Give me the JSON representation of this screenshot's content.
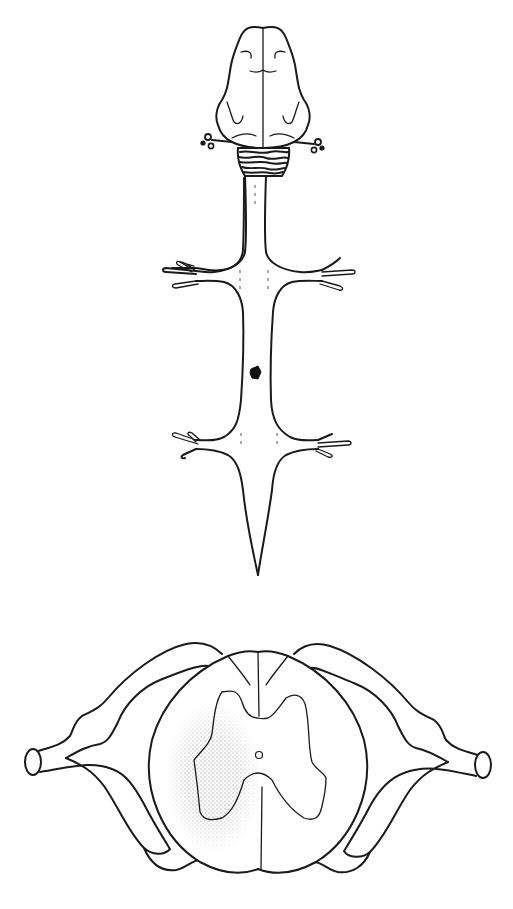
{
  "figure": {
    "type": "anatomical-line-drawing",
    "panels": [
      {
        "id": "dorsal-view",
        "description": "Dorsal view of brain and spinal cord with two pairs of limb nerve plexuses and a small dark lesion mark on the left margin of the thoracic cord",
        "parts": [
          "brain",
          "cerebellum",
          "spinal-cord",
          "cervical-nerve-roots",
          "lumbar-nerve-roots",
          "lesion-marker",
          "filum-terminale"
        ]
      },
      {
        "id": "cross-section",
        "description": "Transverse section of spinal cord with dorsal root ganglia and nerve roots; stippled area marks lesion over left grey matter",
        "parts": [
          "white-matter",
          "grey-matter-butterfly",
          "central-canal",
          "dorsal-median-sulcus",
          "ventral-median-fissure",
          "dorsal-root-left",
          "dorsal-root-right",
          "spinal-nerve-left",
          "spinal-nerve-right",
          "stippled-lesion-area"
        ]
      }
    ]
  },
  "colors": {
    "ink": "#1a1a1a",
    "background": "#ffffff",
    "stipple": "#8a8a8a",
    "lesion": "#111111"
  }
}
